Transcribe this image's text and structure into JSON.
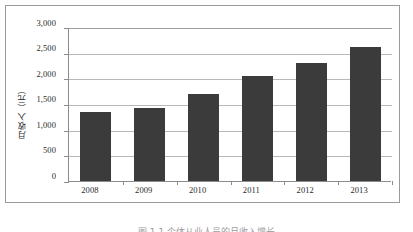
{
  "chart_data": {
    "type": "bar",
    "title": "",
    "categories": [
      "2008",
      "2009",
      "2010",
      "2011",
      "2012",
      "2013"
    ],
    "values": [
      1340,
      1420,
      1690,
      2050,
      2300,
      2610
    ],
    "series": [
      {
        "name": "月收入（元）",
        "values": [
          1340,
          1420,
          1690,
          2050,
          2300,
          2610
        ]
      }
    ],
    "xlabel": "",
    "ylabel": "月收入（元）",
    "ylim": [
      0,
      3000
    ],
    "ytick_labels": [
      "0",
      "500",
      "1,000",
      "1,500",
      "2,000",
      "2,500",
      "3,000"
    ],
    "ytick_values": [
      0,
      500,
      1000,
      1500,
      2000,
      2500,
      3000
    ],
    "grid": true,
    "legend": false,
    "bar_color": "#3b3b3b",
    "gridline_color": "#b8b8b8",
    "axis_color": "#8c8c8c",
    "frame_color": "#9a9a9a",
    "background": "#ffffff"
  },
  "caption": {
    "text": "图 1-1  个体从业人员的月收入增长"
  }
}
